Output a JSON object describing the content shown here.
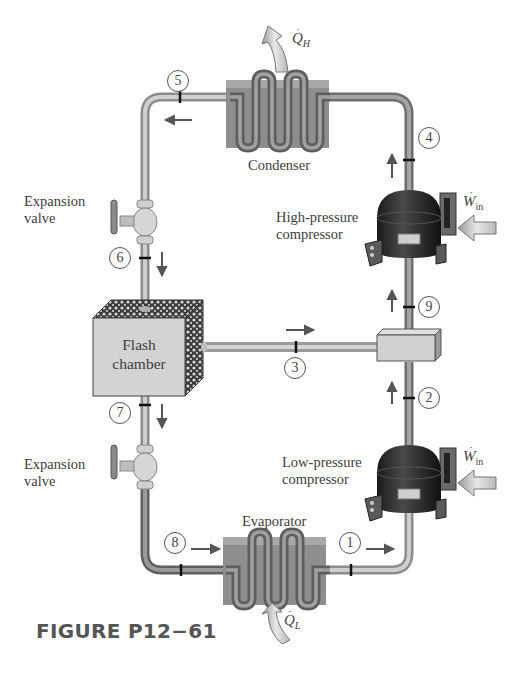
{
  "figure": {
    "caption": "FIGURE P12−61",
    "type": "two-stage refrigeration cycle with flash chamber"
  },
  "components": {
    "condenser": {
      "label": "Condenser"
    },
    "evaporator": {
      "label": "Evaporator"
    },
    "flash_chamber": {
      "label_line1": "Flash",
      "label_line2": "chamber"
    },
    "expansion_valve_upper": {
      "label_line1": "Expansion",
      "label_line2": "valve"
    },
    "expansion_valve_lower": {
      "label_line1": "Expansion",
      "label_line2": "valve"
    },
    "high_pressure_compressor": {
      "label_line1": "High-pressure",
      "label_line2": "compressor"
    },
    "low_pressure_compressor": {
      "label_line1": "Low-pressure",
      "label_line2": "compressor"
    },
    "mixing_chamber": {
      "label": ""
    }
  },
  "heat_work": {
    "q_h": {
      "symbol": "Q",
      "subscript": "H"
    },
    "q_l": {
      "symbol": "Q",
      "subscript": "L"
    },
    "w_in_high": {
      "symbol": "W",
      "subscript": "in"
    },
    "w_in_low": {
      "symbol": "W",
      "subscript": "in"
    }
  },
  "states": [
    {
      "id": "1",
      "label": "1"
    },
    {
      "id": "2",
      "label": "2"
    },
    {
      "id": "3",
      "label": "3"
    },
    {
      "id": "4",
      "label": "4"
    },
    {
      "id": "5",
      "label": "5"
    },
    {
      "id": "6",
      "label": "6"
    },
    {
      "id": "7",
      "label": "7"
    },
    {
      "id": "8",
      "label": "8"
    },
    {
      "id": "9",
      "label": "9"
    }
  ],
  "colors": {
    "pipe": "#a9a9a9",
    "pipe_dark": "#7a7a7a",
    "coil_body": "#8f8f8f",
    "compressor": "#2b2b2b",
    "chamber_face": "#d4d4d4",
    "arrow": "#555555",
    "heat_arrow_fill": "#d6d6d6"
  }
}
